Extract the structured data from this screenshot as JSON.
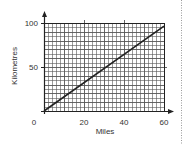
{
  "chart_data": {
    "type": "line",
    "title": "",
    "xlabel": "Miles",
    "ylabel": "Kilometres",
    "xlim": [
      0,
      60
    ],
    "ylim": [
      0,
      100
    ],
    "x_ticks": [
      0,
      20,
      40,
      60
    ],
    "y_ticks": [
      50,
      100
    ],
    "x_tick_labels": [
      "0",
      "20",
      "40",
      "60"
    ],
    "y_tick_labels": [
      "50",
      "100"
    ],
    "grid": true,
    "grid_minor_step_x": 2,
    "grid_minor_step_y": 5,
    "legend": null,
    "series": [
      {
        "name": "Miles to Kilometres",
        "x": [
          0,
          60
        ],
        "y": [
          0,
          96.5
        ]
      }
    ]
  },
  "colors": {
    "grid": "#555555",
    "line": "#222222",
    "axis": "#222222",
    "text": "#333333",
    "dotted_border": "#999999"
  }
}
